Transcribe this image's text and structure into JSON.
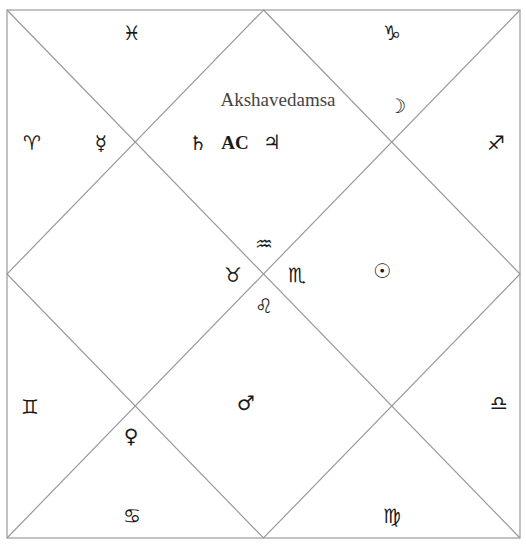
{
  "chart": {
    "title": "Akshavedamsa",
    "style": "North Indian diamond chart",
    "line_color": "#9a9a9a",
    "ascendant_label": "AC",
    "signs": [
      {
        "name": "pisces",
        "glyph": "♓",
        "x": 132,
        "y": 33
      },
      {
        "name": "capricorn",
        "glyph": "♑",
        "x": 392,
        "y": 33
      },
      {
        "name": "aries",
        "glyph": "♈",
        "x": 32,
        "y": 143
      },
      {
        "name": "sagittarius",
        "glyph": "♐",
        "x": 496,
        "y": 143
      },
      {
        "name": "aquarius",
        "glyph": "♒",
        "x": 264,
        "y": 244
      },
      {
        "name": "taurus",
        "glyph": "♉",
        "x": 233,
        "y": 275
      },
      {
        "name": "scorpio",
        "glyph": "♏",
        "x": 297,
        "y": 275
      },
      {
        "name": "leo",
        "glyph": "♌",
        "x": 264,
        "y": 306
      },
      {
        "name": "gemini",
        "glyph": "♊",
        "x": 30,
        "y": 407
      },
      {
        "name": "libra",
        "glyph": "♎",
        "x": 499,
        "y": 403
      },
      {
        "name": "cancer",
        "glyph": "♋",
        "x": 132,
        "y": 516
      },
      {
        "name": "virgo",
        "glyph": "♍",
        "x": 392,
        "y": 516
      }
    ],
    "planets": [
      {
        "name": "moon",
        "glyph": "☽",
        "x": 397,
        "y": 106
      },
      {
        "name": "mercury",
        "glyph": "☿",
        "x": 101,
        "y": 143
      },
      {
        "name": "saturn",
        "glyph": "♄",
        "x": 198,
        "y": 143
      },
      {
        "name": "jupiter",
        "glyph": "♃",
        "x": 272,
        "y": 142
      },
      {
        "name": "sun",
        "glyph": "☉",
        "x": 382,
        "y": 271
      },
      {
        "name": "mars",
        "glyph": "♂",
        "x": 246,
        "y": 403
      },
      {
        "name": "venus",
        "glyph": "♀",
        "x": 131,
        "y": 436
      }
    ],
    "ascendant_house_planets": [
      "saturn",
      "AC",
      "jupiter"
    ]
  }
}
